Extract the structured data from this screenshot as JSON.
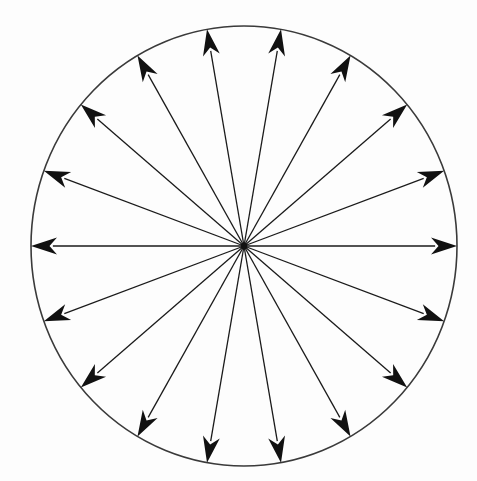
{
  "figure": {
    "background_color": "#fdfdfd",
    "stroke_color": "#1a1a1a",
    "arrow_fill_color": "#111111",
    "circle_stroke_color": "#3a3a3a",
    "circle_stroke_width": 1.6,
    "ray_stroke_width": 1.3
  },
  "chart_data": {
    "type": "scatter",
    "subtitle": "",
    "xlabel": "",
    "ylabel": "",
    "grid": false,
    "legend": null,
    "xlim": [
      31,
      457
    ],
    "ylim": [
      26,
      466
    ],
    "center": {
      "x": 244,
      "y": 246
    },
    "boundary": {
      "shape": "ellipse",
      "cx": 244,
      "cy": 246,
      "rx": 213,
      "ry": 220
    },
    "arrow_count": 18,
    "angle_step_degrees": 20,
    "angle_start_degrees": 0,
    "radius_fraction": 1.0,
    "categories": [
      "0",
      "20",
      "40",
      "60",
      "80",
      "100",
      "120",
      "140",
      "160",
      "180",
      "200",
      "220",
      "240",
      "260",
      "280",
      "300",
      "320",
      "340"
    ],
    "values": [
      1,
      1,
      1,
      1,
      1,
      1,
      1,
      1,
      1,
      1,
      1,
      1,
      1,
      1,
      1,
      1,
      1,
      1
    ],
    "series": [
      {
        "name": "radial vectors",
        "angles_degrees": [
          0,
          20,
          40,
          60,
          80,
          100,
          120,
          140,
          160,
          180,
          200,
          220,
          240,
          260,
          280,
          300,
          320,
          340
        ],
        "magnitudes": [
          1,
          1,
          1,
          1,
          1,
          1,
          1,
          1,
          1,
          1,
          1,
          1,
          1,
          1,
          1,
          1,
          1,
          1
        ]
      }
    ],
    "annotations": []
  }
}
